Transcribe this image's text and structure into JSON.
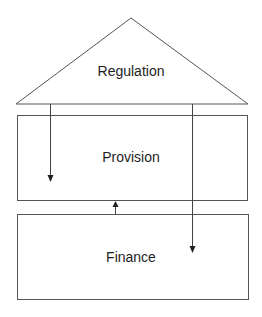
{
  "diagram": {
    "type": "layered-house",
    "nodes": [
      {
        "id": "regulation",
        "label": "Regulation",
        "shape": "triangle"
      },
      {
        "id": "provision",
        "label": "Provision",
        "shape": "rectangle"
      },
      {
        "id": "finance",
        "label": "Finance",
        "shape": "rectangle"
      }
    ],
    "edges": [
      {
        "from": "regulation",
        "to": "provision",
        "direction": "down"
      },
      {
        "from": "regulation",
        "to": "finance",
        "direction": "down"
      },
      {
        "from": "finance",
        "to": "provision",
        "direction": "up"
      }
    ]
  },
  "colors": {
    "stroke": "#555555",
    "text": "#1e1e1e",
    "background": "#ffffff"
  }
}
